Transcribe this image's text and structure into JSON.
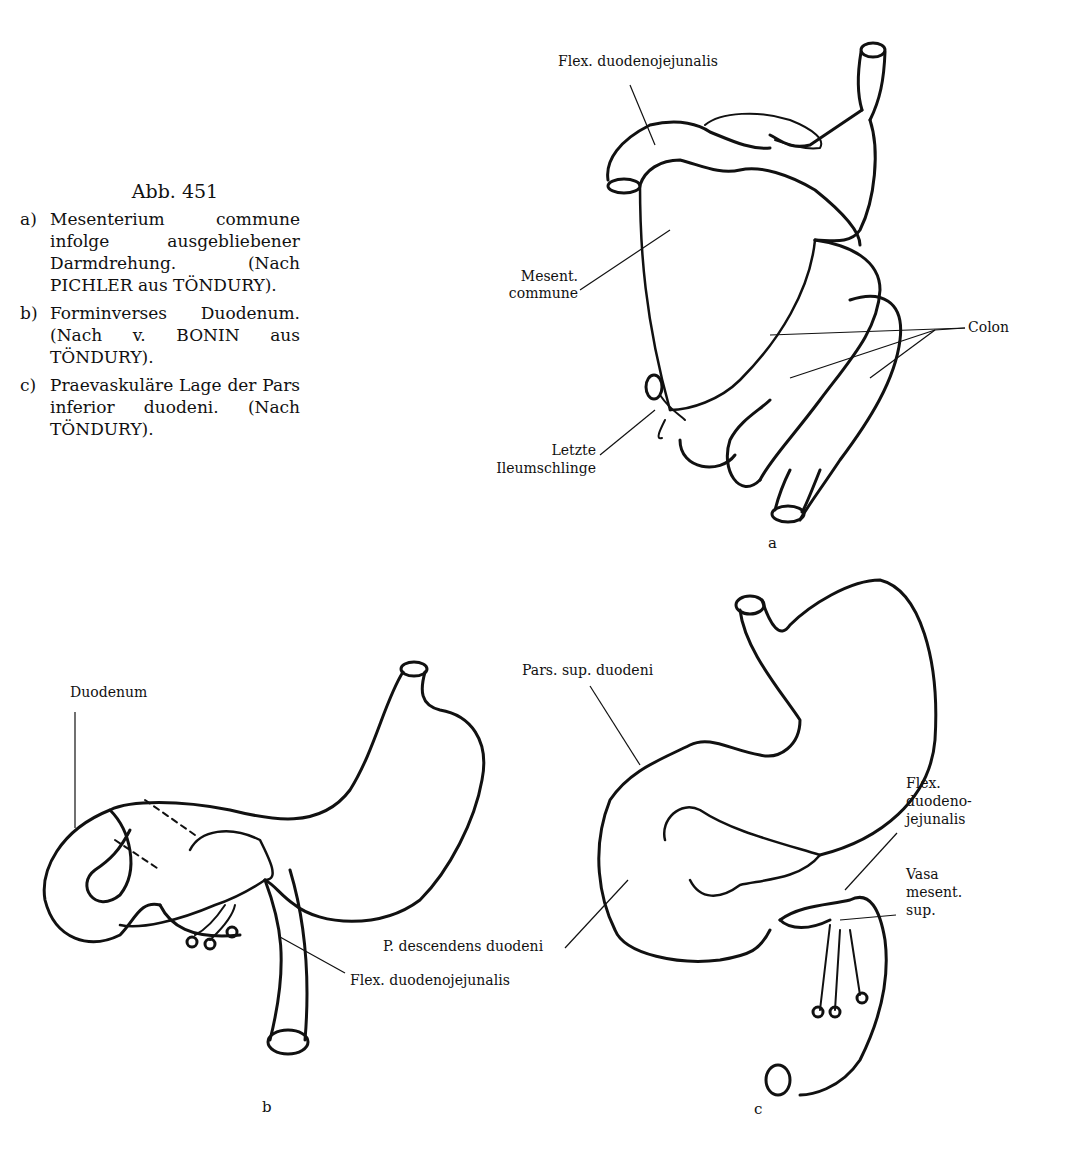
{
  "caption": {
    "title": "Abb. 451",
    "items": [
      {
        "letter": "a)",
        "text": "Mesenterium commune infolge ausgebliebener Darmdrehung. (Nach PICHLER aus TÖNDURY)."
      },
      {
        "letter": "b)",
        "text": "Forminverses Duodenum. (Nach v. BONIN aus TÖNDURY)."
      },
      {
        "letter": "c)",
        "text": "Praevaskuläre Lage der Pars inferior duodeni. (Nach TÖNDURY)."
      }
    ]
  },
  "figure_a": {
    "letter": "a",
    "labels": {
      "flex": "Flex. duodenojejunalis",
      "mesent_1": "Mesent.",
      "mesent_2": "commune",
      "colon": "Colon",
      "letzte_1": "Letzte",
      "letzte_2": "Ileumschlinge"
    }
  },
  "figure_b": {
    "letter": "b",
    "labels": {
      "duodenum": "Duodenum",
      "flex": "Flex. duodenojejunalis"
    }
  },
  "figure_c": {
    "letter": "c",
    "labels": {
      "pars_sup": "Pars. sup. duodeni",
      "p_desc": "P. descendens duodeni",
      "flex_1": "Flex.",
      "flex_2": "duodeno-",
      "flex_3": "jejunalis",
      "vasa_1": "Vasa",
      "vasa_2": "mesent.",
      "vasa_3": "sup."
    }
  }
}
